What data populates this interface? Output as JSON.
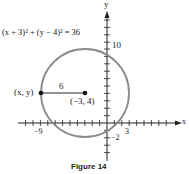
{
  "figure": {
    "caption": "Figure 14",
    "equation": "(x + 3)² + (y − 4)² = 36",
    "x_axis_label": "x",
    "y_axis_label": "y",
    "point_label": "(x, y)",
    "center_label": "(−3, 4)",
    "radius_label": "6",
    "tick_labels": {
      "x_neg9": "−9",
      "x_3": "3",
      "y_10": "10",
      "y_neg2": "−2"
    },
    "circle": {
      "center": [
        -3,
        4
      ],
      "radius": 6,
      "color": "#8a8a8a"
    }
  }
}
